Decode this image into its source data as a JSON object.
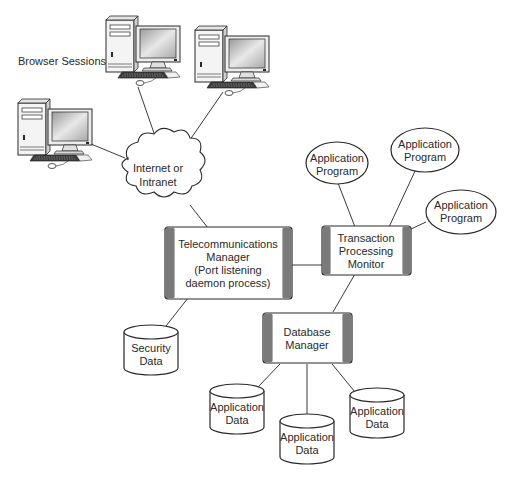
{
  "diagram": {
    "colors": {
      "stroke": "#2a2a2a",
      "box_side_bar": "#7a7a7a",
      "box_fill": "#ffffff",
      "screen_gray": "#c8c8c8"
    },
    "caption": "Browser Sessions",
    "network": {
      "label_line1": "Internet or",
      "label_line2": "Intranet"
    },
    "telecom_manager": {
      "lines": [
        "Telecommunications",
        "Manager",
        "(Port listening",
        "daemon process)"
      ]
    },
    "tp_monitor": {
      "lines": [
        "Transaction",
        "Processing",
        "Monitor"
      ]
    },
    "db_manager": {
      "lines": [
        "Database",
        "Manager"
      ]
    },
    "security_data": {
      "lines": [
        "Security",
        "Data"
      ]
    },
    "application_programs": [
      {
        "lines": [
          "Application",
          "Program"
        ]
      },
      {
        "lines": [
          "Application",
          "Program"
        ]
      },
      {
        "lines": [
          "Application",
          "Program"
        ]
      }
    ],
    "application_data": [
      {
        "lines": [
          "Application",
          "Data"
        ]
      },
      {
        "lines": [
          "Application",
          "Data"
        ]
      },
      {
        "lines": [
          "Application",
          "Data"
        ]
      }
    ],
    "computers": [
      {
        "name": "browser-client-1"
      },
      {
        "name": "browser-client-2"
      },
      {
        "name": "browser-client-3"
      }
    ]
  }
}
